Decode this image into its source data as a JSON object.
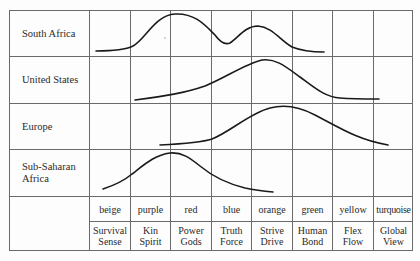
{
  "rows": [
    {
      "label": "South Africa"
    },
    {
      "label": "United States"
    },
    {
      "label": "Europe"
    },
    {
      "label": "Sub-Saharan Africa",
      "line1": "Sub-Saharan",
      "line2": "Africa"
    }
  ],
  "colors": [
    "beige",
    "purple",
    "red",
    "blue",
    "orange",
    "green",
    "yellow",
    "turquoise"
  ],
  "codes": [
    {
      "line1": "Survival",
      "line2": "Sense"
    },
    {
      "line1": "Kin",
      "line2": "Spirit"
    },
    {
      "line1": "Power",
      "line2": "Gods"
    },
    {
      "line1": "Truth",
      "line2": "Force"
    },
    {
      "line1": "Strive",
      "line2": "Drive"
    },
    {
      "line1": "Human",
      "line2": "Bond"
    },
    {
      "line1": "Flex",
      "line2": "Flow"
    },
    {
      "line1": "Global",
      "line2": "View"
    }
  ],
  "style": {
    "grid_color": "#6a6a6a",
    "curve_color": "#1a1a1a"
  }
}
